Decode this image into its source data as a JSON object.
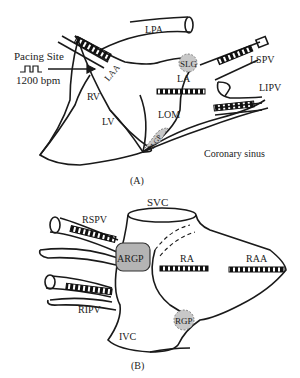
{
  "panel_a": {
    "caption": "(A)",
    "pacing_site": "Pacing Site",
    "pacing_rate": "1200 bpm",
    "labels": {
      "lpa": "LPA",
      "laa": "LAA",
      "rv": "RV",
      "lv": "LV",
      "la": "LA",
      "lom": "LOM",
      "slgp": "SLG",
      "ilgp": "ILGP",
      "lspv": "LSPV",
      "lipv": "LIPV",
      "coronary_sinus": "Coronary sinus"
    }
  },
  "panel_b": {
    "caption": "(B)",
    "labels": {
      "svc": "SVC",
      "rspv": "RSPV",
      "argp": "ARGP",
      "ra": "RA",
      "raa": "RAA",
      "ripv": "RIPV",
      "ivc": "IVC",
      "rgp": "RGP"
    }
  },
  "colors": {
    "line": "#1a1a1a",
    "ganglion_fill": "#c8c8c8",
    "argp_fill": "#b4b4b4"
  }
}
